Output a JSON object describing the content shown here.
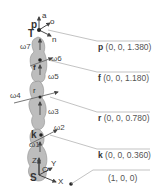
{
  "diagram": {
    "type": "robot-arm-kinematic-diagram",
    "colors": {
      "link_fill": "#b9b9b9",
      "link_stroke": "#8f8f8f",
      "arrow": "#444444",
      "leader_line": "#9a9a9a",
      "text": "#444444"
    },
    "tool_frame": {
      "origin_label": "T",
      "position_label": "p",
      "axes": [
        "a",
        "o",
        "n"
      ]
    },
    "base_frame": {
      "origin_label": "S",
      "center_label": "O",
      "axes": [
        "Z",
        "Y",
        "X"
      ]
    },
    "joints": [
      "ω7",
      "ω6",
      "ω5",
      "ω4",
      "ω3",
      "ω2",
      "ω1"
    ],
    "points": {
      "f": "f",
      "r": "r",
      "k": "k"
    },
    "coordinates": [
      {
        "name": "p",
        "value": "(0, 0, 1.380)"
      },
      {
        "name": "f",
        "value": "(0, 0, 1.180)"
      },
      {
        "name": "r",
        "value": "(0, 0, 0.780)"
      },
      {
        "name": "k",
        "value": "(0, 0, 0.360)"
      },
      {
        "name": "",
        "value": "(1, 0, 0)"
      }
    ]
  }
}
